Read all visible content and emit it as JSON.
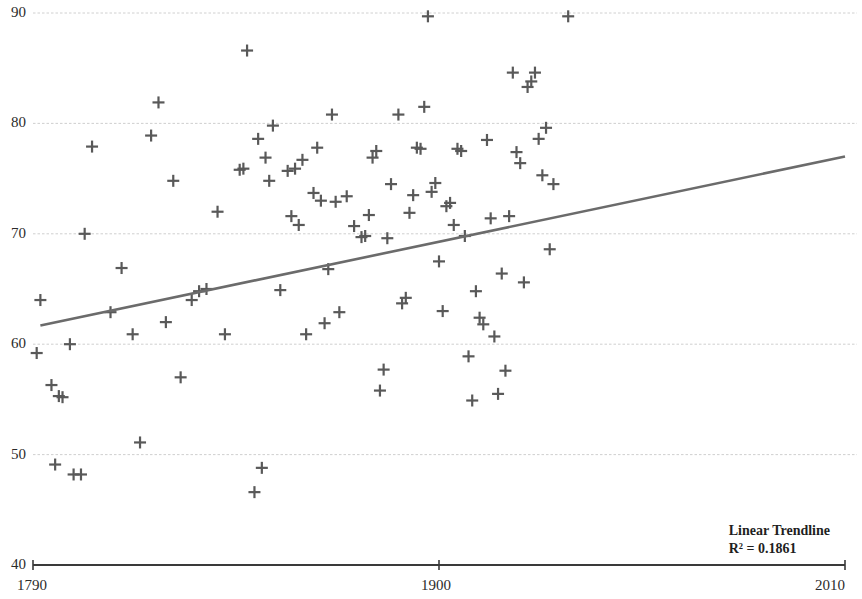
{
  "chart_data": {
    "type": "scatter",
    "title": "",
    "xlabel": "",
    "ylabel": "",
    "xlim": [
      1790,
      2010
    ],
    "ylim": [
      40,
      90
    ],
    "grid": true,
    "x_ticks": [
      1790,
      1900,
      2010
    ],
    "x_tick_labels": [
      "1790",
      "1900",
      "2010"
    ],
    "y_ticks": [
      40,
      50,
      60,
      70,
      80,
      90
    ],
    "y_tick_labels": [
      "40",
      "50",
      "60",
      "70",
      "80",
      "90"
    ],
    "marker_style": "plus",
    "marker_color": "#595959",
    "grid_color": "#c8c8c8",
    "axis_color": "#3a3a3a",
    "points": [
      [
        1791,
        59.2
      ],
      [
        1792,
        64.0
      ],
      [
        1795,
        56.3
      ],
      [
        1796,
        49.1
      ],
      [
        1797,
        55.3
      ],
      [
        1798,
        55.2
      ],
      [
        1800,
        60.0
      ],
      [
        1801,
        48.2
      ],
      [
        1803,
        48.2
      ],
      [
        1804,
        70.0
      ],
      [
        1806,
        77.9
      ],
      [
        1811,
        62.9
      ],
      [
        1814,
        66.9
      ],
      [
        1817,
        60.9
      ],
      [
        1819,
        51.1
      ],
      [
        1822,
        78.9
      ],
      [
        1824,
        81.9
      ],
      [
        1826,
        62.0
      ],
      [
        1828,
        74.8
      ],
      [
        1830,
        57.0
      ],
      [
        1833,
        64.0
      ],
      [
        1835,
        64.8
      ],
      [
        1837,
        65.0
      ],
      [
        1840,
        72.0
      ],
      [
        1842,
        60.9
      ],
      [
        1846,
        75.8
      ],
      [
        1847,
        75.9
      ],
      [
        1848,
        86.6
      ],
      [
        1850,
        46.6
      ],
      [
        1851,
        78.6
      ],
      [
        1852,
        48.8
      ],
      [
        1853,
        76.9
      ],
      [
        1854,
        74.8
      ],
      [
        1855,
        79.8
      ],
      [
        1857,
        64.9
      ],
      [
        1859,
        75.7
      ],
      [
        1860,
        71.6
      ],
      [
        1861,
        75.9
      ],
      [
        1862,
        70.8
      ],
      [
        1863,
        76.7
      ],
      [
        1864,
        60.9
      ],
      [
        1866,
        73.7
      ],
      [
        1867,
        77.8
      ],
      [
        1868,
        73.0
      ],
      [
        1869,
        61.9
      ],
      [
        1870,
        66.8
      ],
      [
        1871,
        80.8
      ],
      [
        1872,
        72.9
      ],
      [
        1873,
        62.9
      ],
      [
        1875,
        73.4
      ],
      [
        1877,
        70.7
      ],
      [
        1879,
        69.7
      ],
      [
        1880,
        69.8
      ],
      [
        1881,
        71.7
      ],
      [
        1882,
        76.9
      ],
      [
        1883,
        77.5
      ],
      [
        1884,
        55.8
      ],
      [
        1885,
        57.7
      ],
      [
        1886,
        69.6
      ],
      [
        1887,
        74.5
      ],
      [
        1889,
        80.8
      ],
      [
        1890,
        63.7
      ],
      [
        1891,
        64.2
      ],
      [
        1892,
        71.9
      ],
      [
        1893,
        73.5
      ],
      [
        1894,
        77.8
      ],
      [
        1895,
        77.7
      ],
      [
        1896,
        81.5
      ],
      [
        1897,
        89.7
      ],
      [
        1898,
        73.8
      ],
      [
        1899,
        74.6
      ],
      [
        1900,
        67.5
      ],
      [
        1901,
        63.0
      ],
      [
        1902,
        72.5
      ],
      [
        1903,
        72.8
      ],
      [
        1904,
        70.8
      ],
      [
        1905,
        77.7
      ],
      [
        1906,
        77.5
      ],
      [
        1907,
        69.8
      ],
      [
        1908,
        58.9
      ],
      [
        1909,
        54.9
      ],
      [
        1910,
        64.8
      ],
      [
        1911,
        62.4
      ],
      [
        1912,
        61.8
      ],
      [
        1913,
        78.5
      ],
      [
        1914,
        71.4
      ],
      [
        1915,
        60.7
      ],
      [
        1916,
        55.5
      ],
      [
        1917,
        66.4
      ],
      [
        1918,
        57.6
      ],
      [
        1919,
        71.6
      ],
      [
        1920,
        84.6
      ],
      [
        1921,
        77.4
      ],
      [
        1922,
        76.4
      ],
      [
        1923,
        65.6
      ],
      [
        1924,
        83.3
      ],
      [
        1925,
        83.8
      ],
      [
        1926,
        84.6
      ],
      [
        1927,
        78.6
      ],
      [
        1928,
        75.3
      ],
      [
        1929,
        79.6
      ],
      [
        1930,
        68.6
      ],
      [
        1931,
        74.5
      ],
      [
        1935,
        89.7
      ]
    ],
    "trendline": {
      "label": "Linear Trendline",
      "r2_label": "R² = 0.1861",
      "r2": 0.1861,
      "color": "#6b6b6b",
      "x_start": 1792,
      "y_start": 61.7,
      "x_end": 2010,
      "y_end": 77.0
    }
  }
}
